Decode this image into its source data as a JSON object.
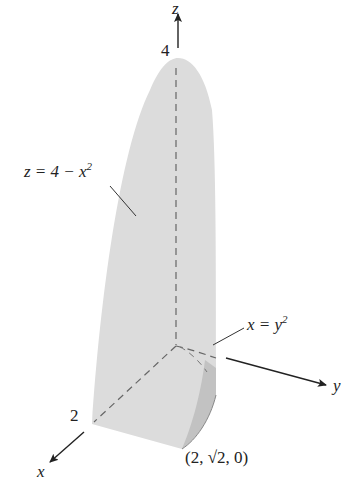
{
  "figure": {
    "type": "3d-solid-region",
    "colors": {
      "surface": "#dcdcdc",
      "side_face": "#c4c4c4",
      "axis": "#222222",
      "dashed": "#666666",
      "background": "#ffffff"
    },
    "axes": {
      "z": {
        "label": "z",
        "tick_label": "4"
      },
      "x": {
        "label": "x",
        "tick_label": "2"
      },
      "y": {
        "label": "y"
      }
    },
    "annotations": {
      "surface_eq": {
        "lhs": "z = 4 − x",
        "exp": "2"
      },
      "cylinder_eq": {
        "lhs": "x = y",
        "exp": "2"
      },
      "corner_point": "(2, √2, 0)"
    }
  }
}
